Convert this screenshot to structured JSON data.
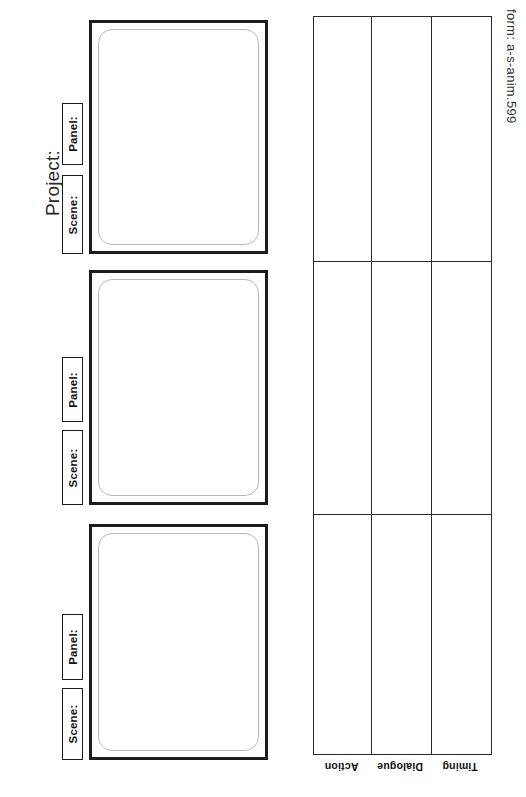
{
  "document": {
    "kind": "storyboard-form",
    "project_label": "Project:",
    "form_code": "form: a-s-anim.599"
  },
  "panels": [
    {
      "index": 1,
      "panel_label": "Panel:",
      "scene_label": "Scene:",
      "panel_value": "",
      "scene_value": "",
      "drawing_area": ""
    },
    {
      "index": 2,
      "panel_label": "Panel:",
      "scene_label": "Scene:",
      "panel_value": "",
      "scene_value": "",
      "drawing_area": ""
    },
    {
      "index": 3,
      "panel_label": "Panel:",
      "scene_label": "Scene:",
      "panel_value": "",
      "scene_value": "",
      "drawing_area": ""
    }
  ],
  "notes_grid": {
    "row_headers": [
      "Action",
      "Dialogue",
      "Timing"
    ],
    "columns": 3,
    "rows": 3,
    "cells": [
      [
        "",
        "",
        ""
      ],
      [
        "",
        "",
        ""
      ],
      [
        "",
        "",
        ""
      ]
    ]
  },
  "colors": {
    "ink": "#1c1c1c",
    "grid_line": "#2a2a2a",
    "inner_frame": "#b9b9b9",
    "paper": "#ffffff"
  }
}
